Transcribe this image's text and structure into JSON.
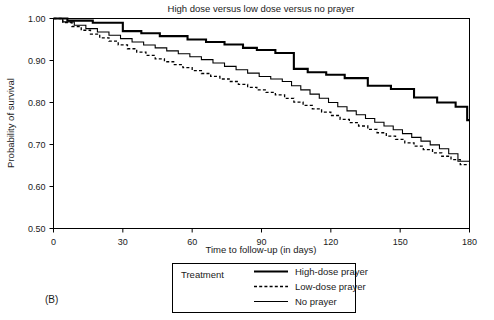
{
  "panel": {
    "label": "(B)"
  },
  "chart_data": {
    "type": "line",
    "subtype": "kaplan-meier-step",
    "title": "High dose versus low dose versus no prayer",
    "xlabel": "Time to follow-up (in days)",
    "ylabel": "Probability of survival",
    "xlim": [
      0,
      180
    ],
    "ylim": [
      0.5,
      1.0
    ],
    "xticks": [
      0,
      30,
      60,
      90,
      120,
      150,
      180
    ],
    "xtick_labels": [
      "0",
      "30",
      "60",
      "90",
      "120",
      "150",
      "180"
    ],
    "yticks": [
      0.5,
      0.6,
      0.7,
      0.8,
      0.9,
      1.0
    ],
    "ytick_labels": [
      "0.50",
      "0.60",
      "0.70",
      "0.80",
      "0.90",
      "1.00"
    ],
    "grid": false,
    "legend_position": "below-plot",
    "legend_title": "Treatment",
    "series": [
      {
        "name": "High-dose prayer",
        "style": "solid-thick",
        "color": "#000000",
        "stroke_width": 2.1,
        "dash": "none",
        "x": [
          0,
          6,
          6,
          17,
          17,
          30,
          30,
          38,
          38,
          46,
          46,
          58,
          58,
          66,
          66,
          74,
          74,
          82,
          82,
          88,
          88,
          96,
          96,
          104,
          104,
          110,
          110,
          118,
          118,
          126,
          126,
          136,
          136,
          146,
          146,
          156,
          156,
          166,
          166,
          174,
          174,
          179,
          179,
          180
        ],
        "y": [
          1.0,
          1.0,
          0.995,
          0.995,
          0.99,
          0.99,
          0.97,
          0.97,
          0.965,
          0.965,
          0.958,
          0.958,
          0.95,
          0.95,
          0.944,
          0.944,
          0.938,
          0.938,
          0.93,
          0.93,
          0.925,
          0.925,
          0.918,
          0.918,
          0.88,
          0.88,
          0.872,
          0.872,
          0.866,
          0.866,
          0.858,
          0.858,
          0.84,
          0.84,
          0.832,
          0.832,
          0.812,
          0.812,
          0.8,
          0.8,
          0.79,
          0.79,
          0.758,
          0.758
        ]
      },
      {
        "name": "Low-dose prayer",
        "style": "dashed",
        "color": "#000000",
        "stroke_width": 1.3,
        "dash": "3,2.2",
        "x": [
          0,
          4,
          4,
          8,
          8,
          12,
          12,
          16,
          16,
          20,
          20,
          24,
          24,
          28,
          28,
          32,
          32,
          36,
          36,
          40,
          40,
          44,
          44,
          48,
          48,
          52,
          52,
          56,
          56,
          60,
          60,
          64,
          64,
          68,
          68,
          72,
          72,
          76,
          76,
          80,
          80,
          84,
          84,
          88,
          88,
          92,
          92,
          96,
          96,
          100,
          100,
          104,
          104,
          108,
          108,
          112,
          112,
          116,
          116,
          120,
          120,
          124,
          124,
          128,
          128,
          132,
          132,
          136,
          136,
          140,
          140,
          144,
          144,
          148,
          148,
          152,
          152,
          156,
          156,
          160,
          160,
          164,
          164,
          168,
          168,
          172,
          172,
          176,
          176,
          180
        ],
        "y": [
          1.0,
          1.0,
          0.99,
          0.99,
          0.981,
          0.981,
          0.972,
          0.972,
          0.963,
          0.963,
          0.954,
          0.954,
          0.946,
          0.946,
          0.937,
          0.937,
          0.928,
          0.928,
          0.92,
          0.92,
          0.912,
          0.912,
          0.904,
          0.904,
          0.897,
          0.897,
          0.89,
          0.89,
          0.883,
          0.883,
          0.876,
          0.876,
          0.869,
          0.869,
          0.862,
          0.862,
          0.856,
          0.856,
          0.85,
          0.85,
          0.843,
          0.843,
          0.836,
          0.836,
          0.83,
          0.83,
          0.824,
          0.824,
          0.818,
          0.818,
          0.81,
          0.81,
          0.801,
          0.801,
          0.793,
          0.793,
          0.785,
          0.785,
          0.777,
          0.777,
          0.769,
          0.769,
          0.76,
          0.76,
          0.752,
          0.752,
          0.744,
          0.744,
          0.736,
          0.736,
          0.728,
          0.728,
          0.72,
          0.72,
          0.712,
          0.712,
          0.704,
          0.704,
          0.696,
          0.696,
          0.688,
          0.688,
          0.68,
          0.68,
          0.672,
          0.672,
          0.664,
          0.664,
          0.652,
          0.652
        ]
      },
      {
        "name": "No prayer",
        "style": "solid-thin",
        "color": "#000000",
        "stroke_width": 1.1,
        "dash": "none",
        "x": [
          0,
          4,
          4,
          9,
          9,
          14,
          14,
          19,
          19,
          24,
          24,
          29,
          29,
          34,
          34,
          39,
          39,
          44,
          44,
          49,
          49,
          54,
          54,
          59,
          59,
          64,
          64,
          69,
          69,
          74,
          74,
          79,
          79,
          84,
          84,
          89,
          89,
          94,
          94,
          99,
          99,
          103,
          103,
          107,
          107,
          111,
          111,
          115,
          115,
          119,
          119,
          123,
          123,
          127,
          127,
          131,
          131,
          135,
          135,
          139,
          139,
          143,
          143,
          147,
          147,
          151,
          151,
          155,
          155,
          159,
          159,
          163,
          163,
          167,
          167,
          171,
          171,
          175,
          175,
          180
        ],
        "y": [
          1.0,
          1.0,
          0.992,
          0.992,
          0.984,
          0.984,
          0.976,
          0.976,
          0.968,
          0.968,
          0.96,
          0.96,
          0.952,
          0.952,
          0.944,
          0.944,
          0.937,
          0.937,
          0.93,
          0.93,
          0.923,
          0.923,
          0.916,
          0.916,
          0.909,
          0.909,
          0.902,
          0.902,
          0.894,
          0.894,
          0.886,
          0.886,
          0.878,
          0.878,
          0.87,
          0.87,
          0.862,
          0.862,
          0.856,
          0.856,
          0.85,
          0.85,
          0.84,
          0.84,
          0.83,
          0.83,
          0.82,
          0.82,
          0.81,
          0.81,
          0.8,
          0.8,
          0.79,
          0.79,
          0.78,
          0.78,
          0.771,
          0.771,
          0.762,
          0.762,
          0.753,
          0.753,
          0.744,
          0.744,
          0.735,
          0.735,
          0.726,
          0.726,
          0.717,
          0.717,
          0.708,
          0.708,
          0.699,
          0.699,
          0.69,
          0.69,
          0.678,
          0.678,
          0.66,
          0.66
        ]
      }
    ]
  }
}
